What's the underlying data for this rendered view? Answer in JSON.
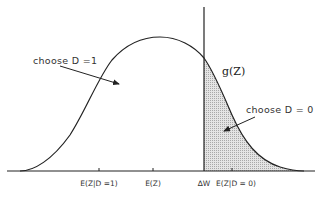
{
  "diagram": {
    "curve_label": "g(Z)",
    "regions": [
      {
        "label": "choose D =1",
        "shaded": false
      },
      {
        "label": "choose D = 0",
        "shaded": true
      }
    ],
    "axis_ticks": [
      {
        "label": "E(Z|D =1)"
      },
      {
        "label": "E(Z)"
      },
      {
        "label": "∆W"
      },
      {
        "label": "E(Z|D = 0)"
      }
    ],
    "colors": {
      "line": "#222222",
      "shade": "#d0d0d0",
      "text": "#333333"
    }
  }
}
